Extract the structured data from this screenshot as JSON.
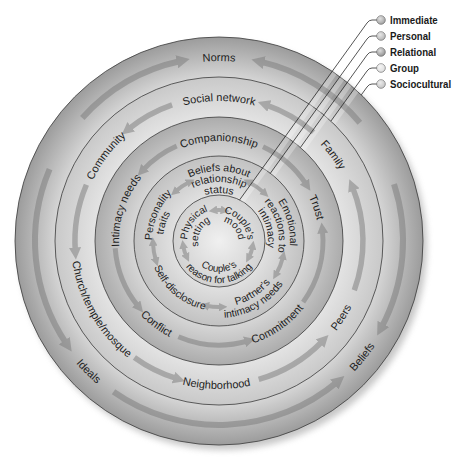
{
  "colors": {
    "sociocultural": {
      "inner": "#d6d6d6",
      "outer": "#9c9c9c"
    },
    "group": {
      "inner": "#e3e3e3",
      "outer": "#c9c9c9"
    },
    "relational": {
      "inner": "#d6d6d6",
      "outer": "#acacac"
    },
    "personal": {
      "inner": "#e0e0e0",
      "outer": "#c2c2c2"
    },
    "immediate": {
      "inner": "#f0f0f0",
      "outer": "#d2d2d2"
    },
    "arrow": "#7a7a7a",
    "shadow": "#9a9a9a"
  },
  "legend": {
    "items": [
      {
        "label": "Immediate",
        "color": "#9c9c9c"
      },
      {
        "label": "Personal",
        "color": "#b2b2b2"
      },
      {
        "label": "Relational",
        "color": "#8e8e8e"
      },
      {
        "label": "Group",
        "color": "#dcdcdc"
      },
      {
        "label": "Sociocultural",
        "color": "#c2c2c2"
      }
    ]
  },
  "rings": {
    "sociocultural": {
      "labels": [
        "Norms",
        "Beliefs",
        "Ideals"
      ]
    },
    "group": {
      "labels": [
        "Social network",
        "Family",
        "Peers",
        "Neighborhood",
        "Church/temple/mosque",
        "Community"
      ]
    },
    "relational": {
      "labels": [
        "Companionship",
        "Trust",
        "Commitment",
        "Conflict",
        "Intimacy needs"
      ]
    },
    "personal": {
      "labels": [
        {
          "lines": [
            "Beliefs about",
            "relationship",
            "status"
          ]
        },
        {
          "lines": [
            "Emotional",
            "reactions to",
            "intimacy"
          ]
        },
        {
          "lines": [
            "Partner's",
            "intimacy needs"
          ]
        },
        {
          "lines": [
            "Self-disclosure"
          ]
        },
        {
          "lines": [
            "Personality",
            "traits"
          ]
        }
      ]
    },
    "immediate": {
      "labels": [
        {
          "lines": [
            "Physical",
            "setting"
          ]
        },
        {
          "lines": [
            "Couple's",
            "mood"
          ]
        },
        {
          "lines": [
            "Couple's",
            "reason for talking"
          ]
        }
      ]
    }
  }
}
